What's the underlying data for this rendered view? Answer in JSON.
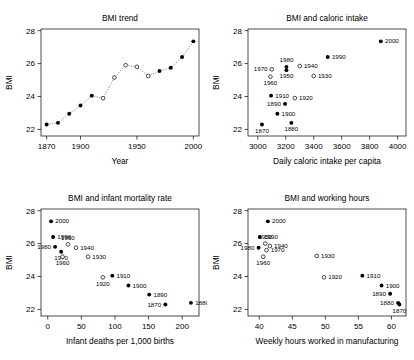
{
  "figure": {
    "width": 414,
    "height": 360,
    "background": "#ffffff",
    "foreground": "#000000",
    "panel_count": 4
  },
  "chart_data": [
    {
      "id": "bmi-trend",
      "type": "line",
      "title": "BMI trend",
      "xlabel": "Year",
      "ylabel": "BMI",
      "xlim": [
        1865,
        2005
      ],
      "ylim": [
        21.6,
        28.1
      ],
      "xticks": [
        1870,
        1900,
        1950,
        2000
      ],
      "yticks": [
        22,
        24,
        26,
        28
      ],
      "grid": false,
      "legend": "none",
      "connected": true,
      "line_style": "dotted",
      "x": [
        1870,
        1880,
        1890,
        1900,
        1910,
        1920,
        1930,
        1940,
        1950,
        1960,
        1970,
        1980,
        1990,
        2000
      ],
      "values": [
        22.3,
        22.4,
        22.95,
        23.45,
        24.05,
        23.9,
        25.15,
        25.9,
        25.8,
        25.25,
        25.55,
        25.75,
        26.4,
        27.35
      ],
      "marker_fill": [
        "filled",
        "filled",
        "filled",
        "filled",
        "filled",
        "open",
        "open",
        "open",
        "open",
        "open",
        "filled",
        "filled",
        "filled",
        "filled"
      ]
    },
    {
      "id": "bmi-caloric-intake",
      "type": "scatter",
      "title": "BMI and caloric intake",
      "xlabel": "Daily caloric intake per capita",
      "ylabel": "BMI",
      "xlim": [
        2930,
        4060
      ],
      "ylim": [
        21.6,
        28.1
      ],
      "xticks": [
        3000,
        3200,
        3400,
        3600,
        3800,
        4000
      ],
      "yticks": [
        22,
        24,
        26,
        28
      ],
      "grid": false,
      "legend": "none",
      "labels": [
        "1870",
        "1880",
        "1890",
        "1900",
        "1910",
        "1920",
        "1930",
        "1940",
        "1950",
        "1960",
        "1970",
        "1980",
        "1990",
        "2000"
      ],
      "x": [
        3030,
        3240,
        3195,
        3140,
        3095,
        3265,
        3400,
        3300,
        3205,
        3090,
        3100,
        3205,
        3500,
        3880
      ],
      "values": [
        22.3,
        22.4,
        23.55,
        22.95,
        24.05,
        23.9,
        25.25,
        25.85,
        25.6,
        25.2,
        25.65,
        25.8,
        26.4,
        27.35
      ],
      "marker_fill": [
        "filled",
        "filled",
        "filled",
        "filled",
        "filled",
        "open",
        "open",
        "open",
        "filled",
        "open",
        "open",
        "filled",
        "filled",
        "filled"
      ],
      "label_pos": [
        "below",
        "below",
        "left",
        "right",
        "right",
        "right",
        "right",
        "right",
        "below",
        "below",
        "left",
        "above",
        "right",
        "right"
      ]
    },
    {
      "id": "bmi-infant-mortality",
      "type": "scatter",
      "title": "BMI and infant mortality rate",
      "xlabel": "Infant deaths per 1,000 births",
      "ylabel": "BMI",
      "xlim": [
        -10,
        225
      ],
      "ylim": [
        21.6,
        28.1
      ],
      "xticks": [
        0,
        50,
        100,
        150,
        200
      ],
      "yticks": [
        22,
        24,
        26,
        28
      ],
      "grid": false,
      "legend": "none",
      "labels": [
        "1870",
        "1880",
        "1890",
        "1900",
        "1910",
        "1920",
        "1930",
        "1940",
        "1950",
        "1960",
        "1970",
        "1980",
        "1990",
        "2000"
      ],
      "x": [
        175,
        213,
        151,
        120,
        96,
        82,
        60,
        42,
        30,
        22,
        20,
        11,
        8,
        5
      ],
      "values": [
        22.3,
        22.4,
        22.9,
        23.45,
        24.05,
        23.95,
        25.2,
        25.75,
        25.95,
        25.2,
        25.5,
        25.8,
        26.4,
        27.35
      ],
      "marker_fill": [
        "filled",
        "filled",
        "filled",
        "filled",
        "filled",
        "open",
        "open",
        "open",
        "open",
        "open",
        "filled",
        "filled",
        "filled",
        "filled"
      ],
      "label_pos": [
        "left",
        "right",
        "right",
        "right",
        "right",
        "below",
        "right",
        "right",
        "above",
        "below",
        "below",
        "left",
        "right",
        "right"
      ]
    },
    {
      "id": "bmi-working-hours",
      "type": "scatter",
      "title": "BMI and working hours",
      "xlabel": "Weekly hours worked in manufacturing",
      "ylabel": "BMI",
      "xlim": [
        38.3,
        62.2
      ],
      "ylim": [
        21.6,
        28.1
      ],
      "xticks": [
        40,
        45,
        50,
        55,
        60
      ],
      "yticks": [
        22,
        24,
        26,
        28
      ],
      "grid": false,
      "legend": "none",
      "labels": [
        "1870",
        "1880",
        "1890",
        "1900",
        "1910",
        "1920",
        "1930",
        "1940",
        "1950",
        "1960",
        "1970",
        "1980",
        "1990",
        "2000"
      ],
      "x": [
        61.2,
        61.0,
        59.8,
        58.5,
        55.6,
        49.8,
        48.7,
        41.6,
        40.9,
        40.6,
        41.1,
        39.9,
        40.1,
        41.3
      ],
      "values": [
        22.3,
        22.4,
        22.95,
        23.45,
        24.05,
        23.95,
        25.25,
        25.85,
        26.0,
        25.2,
        25.6,
        25.75,
        26.4,
        27.35
      ],
      "marker_fill": [
        "filled",
        "filled",
        "filled",
        "filled",
        "filled",
        "open",
        "open",
        "open",
        "open",
        "open",
        "open",
        "filled",
        "filled",
        "filled"
      ],
      "label_pos": [
        "below",
        "left",
        "left",
        "right",
        "right",
        "right",
        "right",
        "right",
        "above",
        "below",
        "right",
        "left",
        "right",
        "right"
      ]
    }
  ]
}
